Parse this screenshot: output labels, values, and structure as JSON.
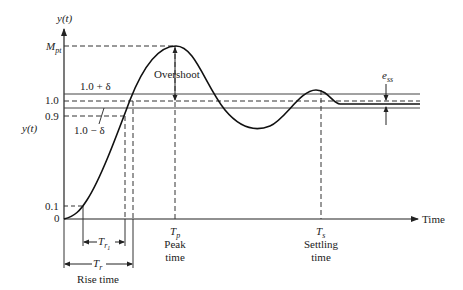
{
  "diagram": {
    "type": "step-response",
    "y_axis_label": "y(t)",
    "y_axis_side_label": "y(t)",
    "x_axis_label": "Time",
    "y_ticks": {
      "mpt": {
        "sym": "M",
        "sub": "pt"
      },
      "one": "1.0",
      "zero_nine": "0.9",
      "zero_one": "0.1",
      "zero": "0"
    },
    "band_upper_label": "1.0 + δ",
    "band_lower_label": "1.0 − δ",
    "overshoot_label": "Overshoot",
    "ess_label": {
      "sym": "e",
      "sub": "ss"
    },
    "peak": {
      "sym": "T",
      "sub": "p",
      "line1": "Peak",
      "line2": "time"
    },
    "settling": {
      "sym": "T",
      "sub": "s",
      "line1": "Settling",
      "line2": "time"
    },
    "rise_inner": {
      "sym": "T",
      "sub": "r",
      "subsub": "1"
    },
    "rise": {
      "sym": "T",
      "sub": "r",
      "caption": "Rise time"
    }
  }
}
